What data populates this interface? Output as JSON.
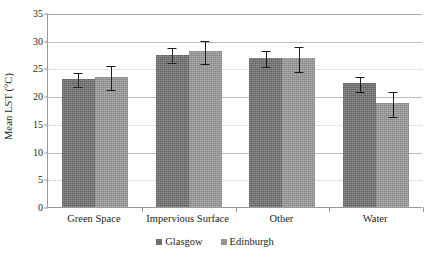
{
  "chart_data": {
    "type": "bar",
    "title": "",
    "xlabel": "",
    "ylabel": "Mean LST (°C)",
    "ylim": [
      0,
      35
    ],
    "ytick_step": 5,
    "yticks": [
      0,
      5,
      10,
      15,
      20,
      25,
      30,
      35
    ],
    "grid": true,
    "grid_orientation": "horizontal",
    "legend_position": "bottom-center",
    "categories": [
      "Green Space",
      "Impervious Surface",
      "Other",
      "Water"
    ],
    "series": [
      {
        "name": "Glasgow",
        "color": "#6e6e6e",
        "values": [
          23.1,
          27.5,
          26.9,
          22.3
        ],
        "errors": [
          1.3,
          1.3,
          1.4,
          1.3
        ]
      },
      {
        "name": "Edinburgh",
        "color": "#949494",
        "values": [
          23.5,
          28.1,
          26.8,
          18.7
        ],
        "errors": [
          2.2,
          2.1,
          2.2,
          2.2
        ]
      }
    ]
  },
  "axis": {
    "y_title": "Mean LST (°C)",
    "tick_labels": [
      "35",
      "30",
      "25",
      "20",
      "15",
      "10",
      "5",
      "0"
    ]
  },
  "legend": {
    "items": [
      {
        "label": "Glasgow",
        "swatch": "legend-swatch-glasgow"
      },
      {
        "label": "Edinburgh",
        "swatch": "legend-swatch-edinburgh"
      }
    ]
  }
}
